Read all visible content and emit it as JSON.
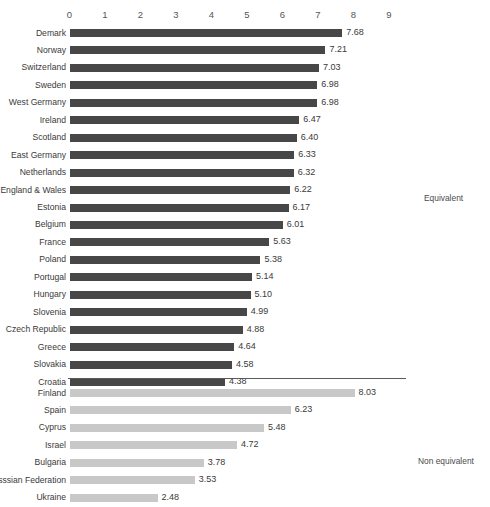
{
  "chart_data": {
    "type": "bar",
    "orientation": "horizontal",
    "title": "",
    "xlabel": "",
    "ylabel": "",
    "xlim": [
      0,
      9
    ],
    "xticks": [
      "0",
      "1",
      "2",
      "3",
      "4",
      "5",
      "6",
      "7",
      "8",
      "9"
    ],
    "grid": false,
    "legend_position": "right",
    "series": [
      {
        "name": "Equivalent",
        "color": "#474747",
        "categories": [
          "Demark",
          "Norway",
          "Switzerland",
          "Sweden",
          "West Germany",
          "Ireland",
          "Scotland",
          "East Germany",
          "Netherlands",
          "England & Wales",
          "Estonia",
          "Belgium",
          "France",
          "Poland",
          "Portugal",
          "Hungary",
          "Slovenia",
          "Czech Republic",
          "Greece",
          "Slovakia",
          "Croatia"
        ],
        "values": [
          7.68,
          7.21,
          7.03,
          6.98,
          6.98,
          6.47,
          6.4,
          6.33,
          6.32,
          6.22,
          6.17,
          6.01,
          5.63,
          5.38,
          5.14,
          5.1,
          4.99,
          4.88,
          4.64,
          4.58,
          4.38
        ],
        "labels": [
          "7.68",
          "7.21",
          "7.03",
          "6.98",
          "6.98",
          "6.47",
          "6.40",
          "6.33",
          "6.32",
          "6.22",
          "6.17",
          "6.01",
          "5.63",
          "5.38",
          "5.14",
          "5.10",
          "4.99",
          "4.88",
          "4.64",
          "4.58",
          "4.38"
        ]
      },
      {
        "name": "Non equivalent",
        "color": "#c8c8c8",
        "categories": [
          "Finland",
          "Spain",
          "Cyprus",
          "Israel",
          "Bulgaria",
          "Russsian Federation",
          "Ukraine"
        ],
        "values": [
          8.03,
          6.23,
          5.48,
          4.72,
          3.78,
          3.53,
          2.48
        ],
        "labels": [
          "8.03",
          "6.23",
          "5.48",
          "4.72",
          "3.78",
          "3.53",
          "2.48"
        ]
      }
    ]
  },
  "captions": {
    "equivalent": "Equivalent",
    "non_equivalent": "Non equivalent"
  },
  "artifacts": {
    "mark_top": "",
    "mark_right_a": "",
    "mark_right_b": ""
  }
}
